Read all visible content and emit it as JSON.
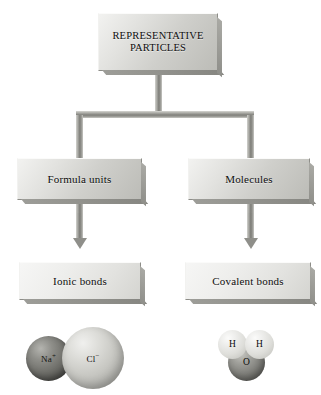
{
  "diagram": {
    "type": "flowchart",
    "nodes": {
      "root": {
        "label": "REPRESENTATIVE PARTICLES"
      },
      "left_branch": {
        "label": "Formula units"
      },
      "right_branch": {
        "label": "Molecules"
      },
      "left_leaf": {
        "label": "Ionic bonds"
      },
      "right_leaf": {
        "label": "Covalent bonds"
      }
    },
    "illustrations": {
      "ionic_example": {
        "name": "sodium-chloride-ion-pair",
        "spheres": [
          {
            "label": "Na",
            "charge": "+",
            "tone": "dark-gray"
          },
          {
            "label": "Cl",
            "charge": "−",
            "tone": "light-gray"
          }
        ]
      },
      "covalent_example": {
        "name": "water-molecule",
        "spheres": [
          {
            "label": "H",
            "charge": "",
            "tone": "light-gray"
          },
          {
            "label": "H",
            "charge": "",
            "tone": "light-gray"
          },
          {
            "label": "O",
            "charge": "",
            "tone": "dark-gray"
          }
        ]
      }
    },
    "colors": {
      "background": "#ffffff",
      "box_face_light": "#f2f2f0",
      "box_face_dark": "#bcbcb7",
      "connector": "#7d7d78",
      "text": "#111111"
    }
  }
}
